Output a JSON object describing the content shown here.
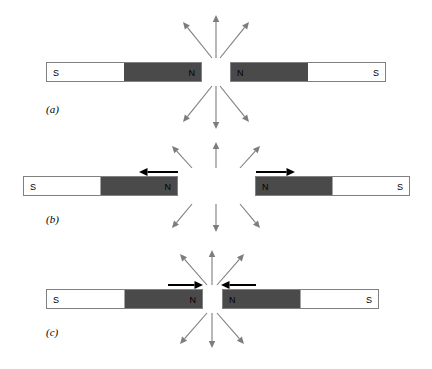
{
  "figure": {
    "background_color": "#ffffff",
    "width": 432,
    "height": 369
  },
  "colors": {
    "magnet_north_fill": "#4a4a4a",
    "magnet_south_fill": "#ffffff",
    "magnet_border": "#808080",
    "field_arrow": "#7d7d7d",
    "force_arrow": "#000000",
    "label_text": "#000000"
  },
  "rows": [
    {
      "id": "a",
      "label": "(a)",
      "label_x": 46,
      "label_y": 103,
      "caption_meaning": "Two bar magnets with like (N) poles facing each other at rest",
      "bar_y": 62,
      "bar_height": 20,
      "left_magnet": {
        "x": 46,
        "width": 156,
        "south_label": "S",
        "north_label": "N",
        "south_side": "left",
        "north_side": "right",
        "split_fraction": 0.5
      },
      "right_magnet": {
        "x": 230,
        "width": 156,
        "south_label": "S",
        "north_label": "N",
        "north_side": "left",
        "south_side": "right",
        "split_fraction": 0.5
      },
      "gap_center_x": 216,
      "gap_width": 28,
      "field_arrows_up": [
        {
          "name": "field-arrow-up-left",
          "x1": 212,
          "y1": 58,
          "x2": 183,
          "y2": 22
        },
        {
          "name": "field-arrow-up-center",
          "x1": 216,
          "y1": 58,
          "x2": 216,
          "y2": 15
        },
        {
          "name": "field-arrow-up-right",
          "x1": 220,
          "y1": 58,
          "x2": 249,
          "y2": 22
        }
      ],
      "field_arrows_down": [
        {
          "name": "field-arrow-down-left",
          "x1": 212,
          "y1": 86,
          "x2": 183,
          "y2": 122
        },
        {
          "name": "field-arrow-down-center",
          "x1": 216,
          "y1": 86,
          "x2": 216,
          "y2": 129
        },
        {
          "name": "field-arrow-down-right",
          "x1": 220,
          "y1": 86,
          "x2": 249,
          "y2": 122
        }
      ],
      "force_arrows": []
    },
    {
      "id": "b",
      "label": "(b)",
      "label_x": 46,
      "label_y": 213,
      "caption_meaning": "Like poles repel: magnets pushed apart, forces point outward",
      "bar_y": 176,
      "bar_height": 20,
      "left_magnet": {
        "x": 23,
        "width": 155,
        "south_label": "S",
        "north_label": "N",
        "south_side": "left",
        "north_side": "right",
        "split_fraction": 0.5
      },
      "right_magnet": {
        "x": 255,
        "width": 155,
        "south_label": "S",
        "north_label": "N",
        "north_side": "left",
        "south_side": "right",
        "split_fraction": 0.5
      },
      "gap_center_x": 216,
      "gap_width": 77,
      "field_arrows_up": [
        {
          "name": "field-arrow-up-left",
          "x1": 192,
          "y1": 168,
          "x2": 172,
          "y2": 146
        },
        {
          "name": "field-arrow-up-center",
          "x1": 216,
          "y1": 168,
          "x2": 216,
          "y2": 142
        },
        {
          "name": "field-arrow-up-right",
          "x1": 240,
          "y1": 168,
          "x2": 260,
          "y2": 146
        }
      ],
      "field_arrows_down": [
        {
          "name": "field-arrow-down-left",
          "x1": 192,
          "y1": 204,
          "x2": 172,
          "y2": 228
        },
        {
          "name": "field-arrow-down-center",
          "x1": 216,
          "y1": 204,
          "x2": 216,
          "y2": 232
        },
        {
          "name": "field-arrow-down-right",
          "x1": 240,
          "y1": 204,
          "x2": 260,
          "y2": 228
        }
      ],
      "force_arrows": [
        {
          "name": "force-arrow-left",
          "x1": 178,
          "y1": 172,
          "x2": 139,
          "y2": 172,
          "direction": "left"
        },
        {
          "name": "force-arrow-right",
          "x1": 256,
          "y1": 172,
          "x2": 295,
          "y2": 172,
          "direction": "right"
        }
      ]
    },
    {
      "id": "c",
      "label": "(c)",
      "label_x": 46,
      "label_y": 326,
      "caption_meaning": "Magnets forced together: applied forces point inward toward the gap",
      "bar_y": 289,
      "bar_height": 20,
      "left_magnet": {
        "x": 46,
        "width": 157,
        "south_label": "S",
        "north_label": "N",
        "south_side": "left",
        "north_side": "right",
        "split_fraction": 0.5
      },
      "right_magnet": {
        "x": 222,
        "width": 157,
        "south_label": "S",
        "north_label": "N",
        "north_side": "left",
        "south_side": "right",
        "split_fraction": 0.5
      },
      "gap_center_x": 212,
      "gap_width": 19,
      "field_arrows_up": [
        {
          "name": "field-arrow-up-left",
          "x1": 207,
          "y1": 285,
          "x2": 180,
          "y2": 254
        },
        {
          "name": "field-arrow-up-center",
          "x1": 212,
          "y1": 285,
          "x2": 212,
          "y2": 250
        },
        {
          "name": "field-arrow-up-right",
          "x1": 217,
          "y1": 285,
          "x2": 244,
          "y2": 254
        }
      ],
      "field_arrows_down": [
        {
          "name": "field-arrow-down-left",
          "x1": 207,
          "y1": 313,
          "x2": 180,
          "y2": 344
        },
        {
          "name": "field-arrow-down-center",
          "x1": 212,
          "y1": 313,
          "x2": 212,
          "y2": 348
        },
        {
          "name": "field-arrow-down-right",
          "x1": 217,
          "y1": 313,
          "x2": 244,
          "y2": 344
        }
      ],
      "force_arrows": [
        {
          "name": "force-arrow-left",
          "x1": 168,
          "y1": 285,
          "x2": 203,
          "y2": 285,
          "direction": "right"
        },
        {
          "name": "force-arrow-right",
          "x1": 256,
          "y1": 285,
          "x2": 221,
          "y2": 285,
          "direction": "left"
        }
      ]
    }
  ]
}
